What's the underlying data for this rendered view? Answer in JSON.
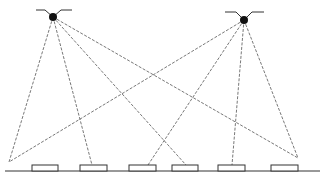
{
  "diagram": {
    "type": "ray-diagram",
    "colors": {
      "line": "#555555",
      "outline": "#333333",
      "source": "#111111",
      "background": "#ffffff"
    },
    "sources": [
      {
        "id": "left-source",
        "x": 53,
        "y": 17,
        "r": 4,
        "wing_left": [
          36,
          10,
          45,
          10
        ],
        "wing_right": [
          61,
          10,
          72,
          10
        ]
      },
      {
        "id": "right-source",
        "x": 244,
        "y": 20,
        "r": 4,
        "wing_left": [
          225,
          12,
          236,
          12
        ],
        "wing_right": [
          252,
          12,
          264,
          12
        ]
      }
    ],
    "ground": {
      "x1": 5,
      "x2": 320,
      "y": 171
    },
    "pads": [
      {
        "x": 32,
        "y": 165,
        "w": 26,
        "h": 6
      },
      {
        "x": 80,
        "y": 165,
        "w": 27,
        "h": 6
      },
      {
        "x": 129,
        "y": 165,
        "w": 27,
        "h": 6
      },
      {
        "x": 172,
        "y": 165,
        "w": 26,
        "h": 6
      },
      {
        "x": 218,
        "y": 165,
        "w": 27,
        "h": 6
      },
      {
        "x": 271,
        "y": 165,
        "w": 27,
        "h": 6
      }
    ],
    "rays": [
      {
        "from": [
          53,
          17
        ],
        "to": [
          9,
          162
        ]
      },
      {
        "from": [
          53,
          17
        ],
        "to": [
          92,
          165
        ]
      },
      {
        "from": [
          53,
          17
        ],
        "to": [
          186,
          165
        ]
      },
      {
        "from": [
          53,
          17
        ],
        "to": [
          298,
          158
        ]
      },
      {
        "from": [
          244,
          20
        ],
        "to": [
          9,
          162
        ]
      },
      {
        "from": [
          244,
          20
        ],
        "to": [
          148,
          165
        ]
      },
      {
        "from": [
          244,
          20
        ],
        "to": [
          232,
          165
        ]
      },
      {
        "from": [
          244,
          20
        ],
        "to": [
          298,
          158
        ]
      }
    ]
  }
}
